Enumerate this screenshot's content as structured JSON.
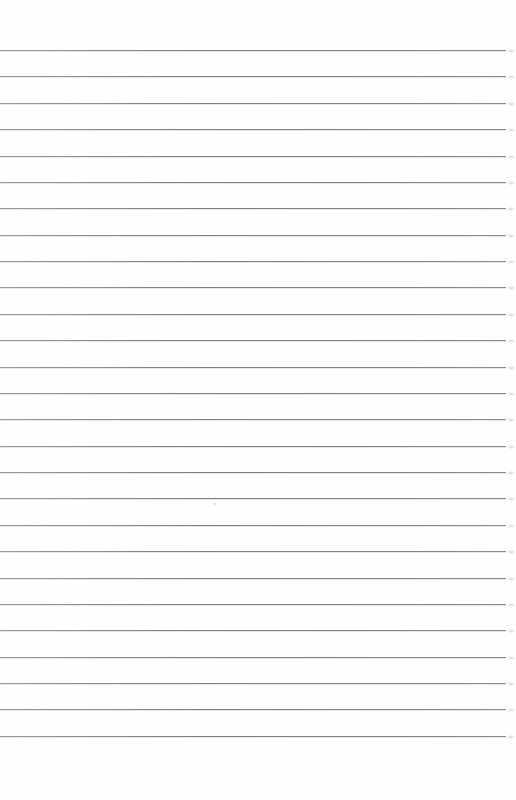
{
  "page": {
    "kind": "lined-paper",
    "background_color": "#fefefe",
    "line_color": "#858585",
    "line_count": 27,
    "first_line_y": 50,
    "line_spacing": 26.375,
    "line_start_x": 0,
    "line_end_x": 506,
    "text_content": ""
  }
}
